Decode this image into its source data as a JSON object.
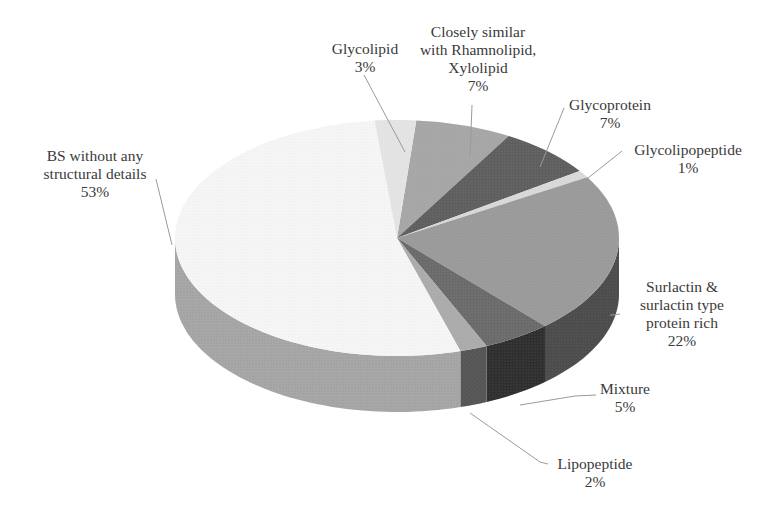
{
  "chart_data": {
    "type": "pie",
    "style": "3d",
    "title": "",
    "start_angle_deg": 5,
    "direction": "clockwise",
    "slices": [
      {
        "label": "Closely similar with Rhamnolipid, Xylolipid",
        "value": 7,
        "pct_label": "7%",
        "color": "#a6a6a6",
        "side": "#8f8f8f"
      },
      {
        "label": "Glycoprotein",
        "value": 7,
        "pct_label": "7%",
        "color": "#5e5e5e",
        "side": "#4a4a4a"
      },
      {
        "label": "Glycolipopeptide",
        "value": 1,
        "pct_label": "1%",
        "color": "#d9d9d9",
        "side": "#c4c4c4"
      },
      {
        "label": "Surlactin & surlactin type protein rich",
        "value": 22,
        "pct_label": "22%",
        "color": "#9a9a9a",
        "side": "#4c4c4c"
      },
      {
        "label": "Mixture",
        "value": 5,
        "pct_label": "5%",
        "color": "#6a6a6a",
        "side": "#2e2e2e"
      },
      {
        "label": "Lipopeptide",
        "value": 2,
        "pct_label": "2%",
        "color": "#ababab",
        "side": "#5a5a5a"
      },
      {
        "label": "BS without any structural details",
        "value": 53,
        "pct_label": "53%",
        "color": "#f6f6f6",
        "side": "#a8a8a8"
      },
      {
        "label": "Glycolipid",
        "value": 3,
        "pct_label": "3%",
        "color": "#e4e4e4",
        "side": "#d0d0d0"
      }
    ],
    "legend": "none (leader-line labels)"
  },
  "labels": {
    "rhamnolipid": {
      "lines": [
        "Closely similar",
        "with Rhamnolipid,",
        "Xylolipid",
        "7%"
      ]
    },
    "glycoprotein": {
      "lines": [
        "Glycoprotein",
        "7%"
      ]
    },
    "glycolipopeptide": {
      "lines": [
        "Glycolipopeptide",
        "1%"
      ]
    },
    "surlactin": {
      "lines": [
        "Surlactin &",
        "surlactin type",
        "protein rich",
        "22%"
      ]
    },
    "mixture": {
      "lines": [
        "Mixture",
        "5%"
      ]
    },
    "lipopeptide": {
      "lines": [
        "Lipopeptide",
        "2%"
      ]
    },
    "bs": {
      "lines": [
        "BS without any",
        "structural details",
        "53%"
      ]
    },
    "glycolipid": {
      "lines": [
        "Glycolipid",
        "3%"
      ]
    }
  }
}
